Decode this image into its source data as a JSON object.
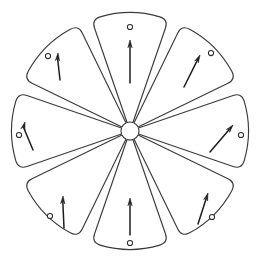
{
  "figure": {
    "background_color": "#ffffff",
    "outline_color": "#3a3a3a",
    "arrow_color": "#1c1c1c",
    "marker_color": "#2a2a2a",
    "center_x": 130,
    "center_y": 131,
    "petal_count": 8,
    "inner_radius": 9,
    "outer_radius": 118,
    "half_angle_deg": 19,
    "corner_radius": 9
  },
  "petals": [
    {
      "id": "petal-top",
      "label": "Top petal",
      "angle_deg": -90,
      "arrow": {
        "from_x": 130,
        "from_y": 83,
        "to_x": 130,
        "to_y": 40,
        "angle_deg": -90
      },
      "marker": {
        "cx": 130,
        "cy": 27,
        "r": 2.6
      }
    },
    {
      "id": "petal-top-right",
      "label": "Upper-right petal",
      "angle_deg": -45,
      "arrow": {
        "from_x": 184,
        "from_y": 87,
        "to_x": 200,
        "to_y": 55,
        "angle_deg": -63
      },
      "marker": {
        "cx": 211,
        "cy": 53,
        "r": 2.6
      }
    },
    {
      "id": "petal-right",
      "label": "Right petal",
      "angle_deg": 0,
      "arrow": {
        "from_x": 210,
        "from_y": 152,
        "to_x": 233,
        "to_y": 125,
        "angle_deg": -50
      },
      "marker": {
        "cx": 241,
        "cy": 135,
        "r": 2.6
      }
    },
    {
      "id": "petal-bottom-right",
      "label": "Lower-right petal",
      "angle_deg": 45,
      "arrow": {
        "from_x": 198,
        "from_y": 224,
        "to_x": 208,
        "to_y": 193,
        "angle_deg": -72
      },
      "marker": {
        "cx": 212,
        "cy": 217,
        "r": 2.6
      }
    },
    {
      "id": "petal-bottom",
      "label": "Bottom petal",
      "angle_deg": 90,
      "arrow": {
        "from_x": 130,
        "from_y": 235,
        "to_x": 130,
        "to_y": 198,
        "angle_deg": -90
      },
      "marker": {
        "cx": 130,
        "cy": 243,
        "r": 2.6
      }
    },
    {
      "id": "petal-bottom-left",
      "label": "Lower-left petal",
      "angle_deg": 135,
      "arrow": {
        "from_x": 64,
        "from_y": 228,
        "to_x": 63,
        "to_y": 196,
        "angle_deg": -88
      },
      "marker": {
        "cx": 50,
        "cy": 216,
        "r": 2.6
      }
    },
    {
      "id": "petal-left",
      "label": "Left petal",
      "angle_deg": 180,
      "arrow": {
        "from_x": 33,
        "from_y": 150,
        "to_x": 25,
        "to_y": 122,
        "angle_deg": -74
      },
      "marker": {
        "cx": 19,
        "cy": 135,
        "r": 2.6
      }
    },
    {
      "id": "petal-top-left",
      "label": "Upper-left petal",
      "angle_deg": -135,
      "arrow": {
        "from_x": 60,
        "from_y": 80,
        "to_x": 58,
        "to_y": 53,
        "angle_deg": -86
      },
      "marker": {
        "cx": 48,
        "cy": 56,
        "r": 2.6
      }
    }
  ]
}
